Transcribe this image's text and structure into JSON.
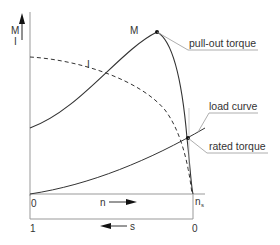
{
  "diagram": {
    "axis_y": {
      "label_top": "M",
      "label_bottom": "I"
    },
    "axis_speed": {
      "start": "0",
      "label": "n",
      "end_main": "n",
      "end_sub": "s"
    },
    "axis_slip": {
      "start": "1",
      "label": "s",
      "end": "0"
    },
    "curves": {
      "torque_label": "M",
      "current_label": "I"
    },
    "annotations": {
      "pull_out": "pull-out torque",
      "load_curve": "load curve",
      "rated_torque": "rated torque"
    },
    "colors": {
      "line": "#333333",
      "axis": "#888888",
      "background": "#ffffff"
    }
  }
}
